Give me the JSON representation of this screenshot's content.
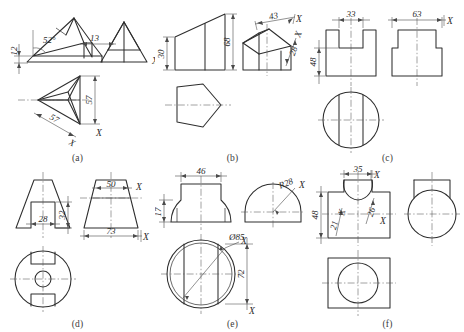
{
  "sheet": {
    "kind": "engineering-drawing-exercise-sheet",
    "description": "Six orthographic projection exercises labelled (a) through (f)",
    "background_color": "#ffffff",
    "line_color": "#2e2e2e",
    "center_line_color": "#555555"
  },
  "panels": [
    {
      "id": "a",
      "caption": "(a)",
      "subject": "pyramid / triangular prism with front, side and top views",
      "dimensions": [
        {
          "name": "height-left",
          "text": "12",
          "orientation": "vertical"
        },
        {
          "name": "angle",
          "text": "52°",
          "orientation": "horizontal"
        },
        {
          "name": "gap",
          "text": "13",
          "orientation": "horizontal"
        },
        {
          "name": "depth",
          "text": "57",
          "orientation": "vertical"
        },
        {
          "name": "width",
          "text": "57",
          "orientation": "oblique"
        }
      ],
      "markers": [
        "X",
        "X",
        "X"
      ]
    },
    {
      "id": "b",
      "caption": "(b)",
      "subject": "truncated pentagonal prism, front view, auxiliary view and top view",
      "dimensions": [
        {
          "name": "height-front",
          "text": "30",
          "orientation": "vertical"
        },
        {
          "name": "height-rear",
          "text": "68",
          "orientation": "vertical"
        },
        {
          "name": "face-width",
          "text": "43",
          "orientation": "oblique"
        },
        {
          "name": "face-depth",
          "text": "28",
          "orientation": "oblique"
        }
      ],
      "markers": [
        "X",
        "X"
      ]
    },
    {
      "id": "c",
      "caption": "(c)",
      "subject": "cylinder with rectangular slot, front view, side view and bottom circular view",
      "dimensions": [
        {
          "name": "slot-width",
          "text": "33",
          "orientation": "horizontal"
        },
        {
          "name": "body-width",
          "text": "63",
          "orientation": "horizontal"
        },
        {
          "name": "height",
          "text": "48",
          "orientation": "vertical"
        }
      ],
      "markers": [
        "X"
      ]
    },
    {
      "id": "d",
      "caption": "(d)",
      "subject": "truncated cone with slot and central bore, two front views and bottom view",
      "dimensions": [
        {
          "name": "slot-width",
          "text": "28",
          "orientation": "horizontal"
        },
        {
          "name": "slot-height",
          "text": "32",
          "orientation": "vertical"
        },
        {
          "name": "top-width",
          "text": "50",
          "orientation": "horizontal"
        },
        {
          "name": "base-width",
          "text": "73",
          "orientation": "horizontal"
        }
      ],
      "markers": [
        "X",
        "X"
      ]
    },
    {
      "id": "e",
      "caption": "(e)",
      "subject": "half-cylinder with rectangular channel, front view, side view and circular top view",
      "dimensions": [
        {
          "name": "channel-width",
          "text": "46",
          "orientation": "horizontal"
        },
        {
          "name": "height",
          "text": "17",
          "orientation": "vertical"
        },
        {
          "name": "radius",
          "text": "R28",
          "orientation": "leader"
        },
        {
          "name": "diameter",
          "text": "Ø85",
          "orientation": "leader"
        },
        {
          "name": "depth",
          "text": "72",
          "orientation": "vertical"
        }
      ],
      "markers": [
        "X",
        "X",
        "X"
      ]
    },
    {
      "id": "f",
      "caption": "(f)",
      "subject": "rectangular block with cylindrical cut, front view, side view and top view",
      "dimensions": [
        {
          "name": "cut-width",
          "text": "35",
          "orientation": "horizontal"
        },
        {
          "name": "height",
          "text": "48",
          "orientation": "vertical"
        },
        {
          "name": "cut-depth",
          "text": "26",
          "orientation": "oblique"
        },
        {
          "name": "edge",
          "text": "21",
          "orientation": "oblique"
        }
      ],
      "markers": [
        "X",
        "X",
        "X"
      ]
    }
  ]
}
